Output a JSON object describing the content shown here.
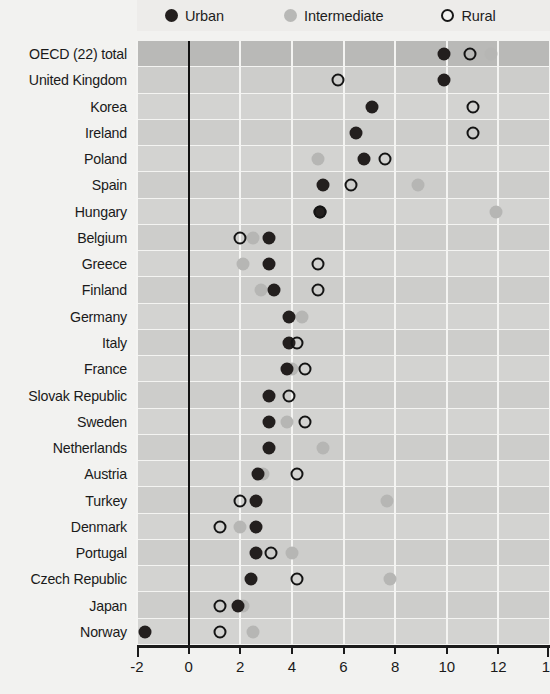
{
  "legend": {
    "items": [
      {
        "key": "urban",
        "label": "Urban",
        "marker": "filled-dark-circle-icon",
        "color": "#231f1e"
      },
      {
        "key": "intermediate",
        "label": "Intermediate",
        "marker": "filled-grey-circle-icon",
        "color": "#b6b6b4"
      },
      {
        "key": "rural",
        "label": "Rural",
        "marker": "open-circle-icon",
        "color": "#141414"
      }
    ]
  },
  "chart_data": {
    "type": "scatter",
    "title": "",
    "xlabel": "",
    "ylabel": "",
    "xlim": [
      -2,
      14
    ],
    "xticks": [
      -2,
      0,
      2,
      4,
      6,
      8,
      10,
      12,
      14
    ],
    "xticklabels": [
      "-2",
      "0",
      "2",
      "4",
      "6",
      "8",
      "10",
      "12",
      "14"
    ],
    "grid": "vertical",
    "zero_reference_line": 0,
    "legend_position": "top",
    "highlight_row": "OECD (22) total",
    "categories": [
      "OECD (22) total",
      "United Kingdom",
      "Korea",
      "Ireland",
      "Poland",
      "Spain",
      "Hungary",
      "Belgium",
      "Greece",
      "Finland",
      "Germany",
      "Italy",
      "France",
      "Slovak Republic",
      "Sweden",
      "Netherlands",
      "Austria",
      "Turkey",
      "Denmark",
      "Portugal",
      "Czech Republic",
      "Japan",
      "Norway"
    ],
    "series": [
      {
        "name": "Urban",
        "values": [
          9.9,
          9.9,
          7.1,
          6.5,
          6.8,
          5.2,
          5.1,
          3.1,
          3.1,
          3.3,
          3.9,
          3.9,
          3.8,
          3.1,
          3.1,
          3.1,
          2.7,
          2.6,
          2.6,
          2.6,
          2.4,
          1.9,
          -1.7
        ]
      },
      {
        "name": "Intermediate",
        "values": [
          11.7,
          null,
          null,
          null,
          5.0,
          8.9,
          11.9,
          2.5,
          2.1,
          2.8,
          4.4,
          null,
          4.0,
          null,
          3.8,
          5.2,
          2.9,
          7.7,
          2.0,
          4.0,
          7.8,
          2.1,
          2.5
        ]
      },
      {
        "name": "Rural",
        "values": [
          10.9,
          5.8,
          11.0,
          11.0,
          7.6,
          6.3,
          5.1,
          2.0,
          5.0,
          5.0,
          null,
          4.2,
          4.5,
          3.9,
          4.5,
          null,
          4.2,
          2.0,
          1.2,
          3.2,
          4.2,
          1.2,
          1.2
        ]
      }
    ]
  },
  "colors": {
    "urban": "#231f1e",
    "intermediate": "#b6b6b4",
    "rural_outline": "#141414",
    "band": "#d3d3d1",
    "band_alt": "#cdcdcb",
    "band_highlight": "#b9b9b7",
    "gridline": "#f4f4f2",
    "axis": "#1b1b1b",
    "page_background": "#f2f2f0"
  }
}
